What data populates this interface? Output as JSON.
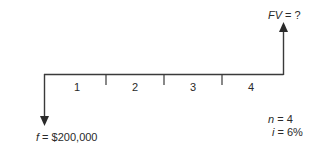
{
  "diagram": {
    "type": "cash-flow-timeline",
    "future_value_label": {
      "var": "FV",
      "eq": " = ?"
    },
    "present_value_label": {
      "var": "f",
      "eq": " = $200,000"
    },
    "periods": [
      "1",
      "2",
      "3",
      "4"
    ],
    "params": {
      "n": {
        "var": "n",
        "eq": " = 4"
      },
      "i": {
        "var": "i",
        "eq": " = 6%"
      }
    },
    "line_color": "#3a3a3a"
  }
}
